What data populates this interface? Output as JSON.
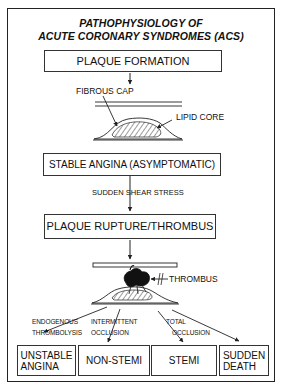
{
  "title": {
    "line1": "PATHOPHYSIOLOGY OF",
    "line2": "ACUTE CORONARY SYNDROMES (ACS)"
  },
  "flow": {
    "step1": "PLAQUE FORMATION",
    "fibrous_cap_label": "FIBROUS CAP",
    "lipid_core_label": "LIPID CORE",
    "step2": "STABLE ANGINA (ASYMPTOMATIC)",
    "trigger": "SUDDEN SHEAR STRESS",
    "step3": "PLAQUE RUPTURE/THROMBUS",
    "thrombus_label": "THROMBUS"
  },
  "pathways": [
    {
      "line1": "ENDOGENOUS",
      "line2": "THROMBOLYSIS"
    },
    {
      "line1": "INTERMITTENT",
      "line2": "OCCLUSION"
    },
    {
      "line1": "TOTAL",
      "line2": "OCCLUSION"
    }
  ],
  "outcomes": [
    {
      "line1": "UNSTABLE",
      "line2": "ANGINA"
    },
    {
      "line1": "NON-STEMI",
      "line2": ""
    },
    {
      "line1": "STEMI",
      "line2": ""
    },
    {
      "line1": "SUDDEN",
      "line2": "DEATH"
    }
  ],
  "colors": {
    "line": "#222222",
    "background": "#ffffff"
  }
}
